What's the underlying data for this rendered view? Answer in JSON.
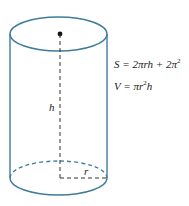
{
  "diagram": {
    "type": "cylinder",
    "stroke_color": "#3e7c9a",
    "dashed_color": "#333333",
    "labels": {
      "height": "h",
      "radius": "r"
    },
    "formulas": {
      "surface_lhs": "S = 2πrh + 2π",
      "surface_exp": "2",
      "volume_lhs": "V = πr",
      "volume_exp": "2",
      "volume_rhs": "h"
    }
  }
}
